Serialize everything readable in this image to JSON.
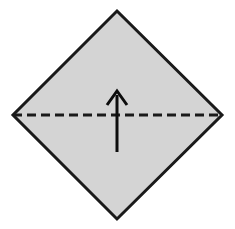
{
  "figure": {
    "canvas": {
      "width": 235,
      "height": 229,
      "background": "#ffffff"
    },
    "paper": {
      "name": "square-sheet-rotated-45",
      "shape": "diamond",
      "fill_color": "#d4d4d4",
      "stroke_color": "#1a1a1a",
      "stroke_width": 3,
      "vertices": {
        "top": {
          "x": 117,
          "y": 11
        },
        "right": {
          "x": 222,
          "y": 115
        },
        "bottom": {
          "x": 117,
          "y": 219
        },
        "left": {
          "x": 13,
          "y": 115
        }
      },
      "points_attr": "117,11 222,115 117,219 13,115"
    },
    "fold_line": {
      "name": "valley-fold-crease",
      "style": "dashed",
      "stroke_color": "#1a1a1a",
      "stroke_width": 3,
      "dash_pattern": "9,5",
      "x1": 13,
      "y1": 115,
      "x2": 222,
      "y2": 115
    },
    "fold_arrow": {
      "name": "fold-direction-arrow",
      "direction": "up",
      "stroke_color": "#0d0d0d",
      "stroke_width": 3,
      "shaft": {
        "x": 117,
        "y_top": 95,
        "y_bottom": 152
      },
      "head": {
        "tip": {
          "x": 117,
          "y": 91
        },
        "left": {
          "x": 107,
          "y": 105
        },
        "right": {
          "x": 127,
          "y": 105
        },
        "points_attr": "107,105 117,91 127,105"
      }
    }
  }
}
